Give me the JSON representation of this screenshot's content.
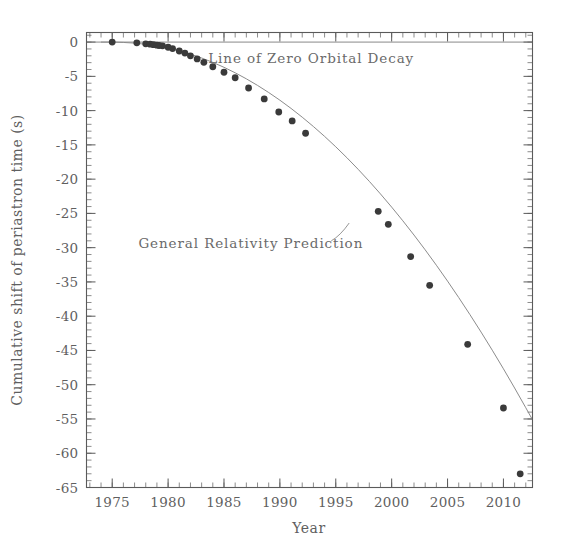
{
  "chart_data": {
    "type": "scatter",
    "title": "",
    "xlabel": "Year",
    "ylabel": "Cumulative shift of periastron time (s)",
    "xlim": [
      1972.7,
      2012.6
    ],
    "ylim": [
      -65,
      1.4
    ],
    "grid": false,
    "legend_position": "none",
    "x_ticks": [
      1975,
      1980,
      1985,
      1990,
      1995,
      2000,
      2005,
      2010
    ],
    "x_tick_labels": [
      "1975",
      "1980",
      "1985",
      "1990",
      "1995",
      "2000",
      "2005",
      "2010"
    ],
    "x_minor_tick_step": 1,
    "y_ticks": [
      0,
      -5,
      -10,
      -15,
      -20,
      -25,
      -30,
      -35,
      -40,
      -45,
      -50,
      -55,
      -60,
      -65
    ],
    "y_tick_labels": [
      "0",
      "-5",
      "-10",
      "-15",
      "-20",
      "-25",
      "-30",
      "-35",
      "-40",
      "-45",
      "-50",
      "-55",
      "-60",
      "-65"
    ],
    "y_minor_tick_step": 1,
    "annotations": [
      {
        "name": "zero-decay-label",
        "text": "Line of Zero Orbital Decay",
        "x": 1992.8,
        "y": -3.1
      },
      {
        "name": "gr-prediction-label",
        "text": "General Relativity Prediction",
        "x": 1987.4,
        "y": -30.0
      }
    ],
    "reference_lines": [
      {
        "name": "line-of-zero-orbital-decay",
        "orientation": "horizontal",
        "value": 0,
        "color": "#7a7a7a"
      }
    ],
    "series": [
      {
        "name": "General Relativity Prediction",
        "type": "line",
        "color": "#8c8c8c",
        "x": [
          1974.0,
          1975.0,
          1976.0,
          1977.0,
          1978.0,
          1979.0,
          1980.0,
          1981.0,
          1982.0,
          1983.0,
          1984.0,
          1985.0,
          1986.0,
          1987.0,
          1988.0,
          1989.0,
          1990.0,
          1991.0,
          1992.0,
          1993.0,
          1994.0,
          1995.0,
          1996.0,
          1997.0,
          1998.0,
          1999.0,
          2000.0,
          2001.0,
          2002.0,
          2003.0,
          2004.0,
          2005.0,
          2006.0,
          2007.0,
          2008.0,
          2009.0,
          2010.0,
          2011.0,
          2012.0,
          2012.6
        ],
        "y": [
          0.0,
          0.0,
          -0.05,
          -0.15,
          -0.32,
          -0.56,
          -0.88,
          -1.28,
          -1.76,
          -2.32,
          -2.96,
          -3.68,
          -4.48,
          -5.36,
          -6.32,
          -7.36,
          -8.48,
          -9.68,
          -10.96,
          -12.32,
          -13.76,
          -15.28,
          -16.88,
          -18.56,
          -20.32,
          -22.16,
          -24.08,
          -26.08,
          -28.16,
          -30.32,
          -32.56,
          -34.88,
          -37.28,
          -39.76,
          -42.32,
          -44.96,
          -47.68,
          -50.48,
          -53.36,
          -55.12
        ]
      },
      {
        "name": "Measured cumulative periastron shift",
        "type": "scatter",
        "color": "#3a3a3a",
        "marker": "filled-circle",
        "x": [
          1975.0,
          1977.2,
          1978.0,
          1978.4,
          1978.7,
          1979.0,
          1979.2,
          1979.5,
          1980.0,
          1980.4,
          1981.0,
          1981.5,
          1982.0,
          1982.6,
          1983.2,
          1984.0,
          1985.0,
          1986.0,
          1987.2,
          1988.6,
          1989.9,
          1991.1,
          1992.3,
          1998.8,
          1999.7,
          2001.7,
          2003.4,
          2006.8,
          2010.0,
          2011.5
        ],
        "y": [
          0.0,
          -0.1,
          -0.25,
          -0.3,
          -0.38,
          -0.45,
          -0.5,
          -0.55,
          -0.75,
          -0.95,
          -1.3,
          -1.6,
          -2.0,
          -2.45,
          -2.95,
          -3.6,
          -4.4,
          -5.2,
          -6.7,
          -8.3,
          -10.2,
          -11.5,
          -13.3,
          -24.7,
          -26.6,
          -31.3,
          -35.5,
          -44.1,
          -53.4,
          -63.0
        ]
      }
    ]
  },
  "axis": {
    "x_title": "Year",
    "y_title": "Cumulative shift of periastron time (s)"
  }
}
